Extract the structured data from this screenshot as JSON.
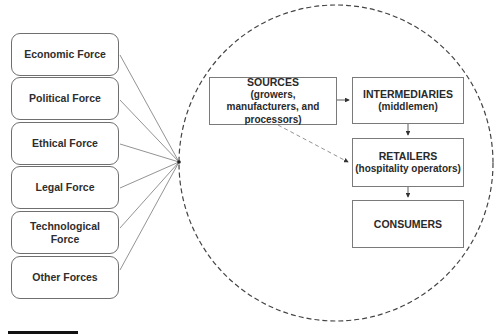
{
  "forces": [
    {
      "label": "Economic Force"
    },
    {
      "label": "Political Force"
    },
    {
      "label": "Ethical Force"
    },
    {
      "label": "Legal Force"
    },
    {
      "label": "Technological Force"
    },
    {
      "label": "Other Forces"
    }
  ],
  "flow": {
    "sources": {
      "title": "SOURCES",
      "subtitle": "(growers, manufacturers, and processors)"
    },
    "intermediaries": {
      "title": "INTERMEDIARIES",
      "subtitle": "(middlemen)"
    },
    "retailers": {
      "title": "RETAILERS",
      "subtitle": "(hospitality operators)"
    },
    "consumers": {
      "title": "CONSUMERS"
    }
  },
  "colors": {
    "box_border": "#7a7a7a",
    "line": "#6a6a6a",
    "text": "#2a2a2a"
  }
}
